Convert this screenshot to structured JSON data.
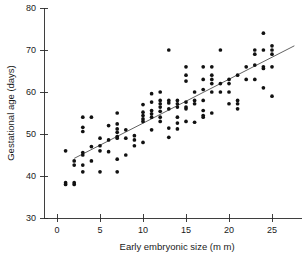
{
  "chart_data": {
    "type": "scatter",
    "title": "",
    "xlabel": "Early embryonic size (m m)",
    "ylabel": "Gestational age (days)",
    "xlim": [
      -1.5,
      28.5
    ],
    "ylim": [
      30,
      80
    ],
    "xticks": [
      0,
      5,
      10,
      15,
      20,
      25
    ],
    "yticks": [
      30,
      40,
      50,
      60,
      70,
      80
    ],
    "xtick_labels": [
      "0",
      "5",
      "10",
      "15",
      "20",
      "25"
    ],
    "ytick_labels": [
      "30",
      "40",
      "50",
      "60",
      "70",
      "80"
    ],
    "grid": false,
    "legend": null,
    "marker": "filled-circle",
    "marker_color": "#111111",
    "fit_line": {
      "label": "linear regression",
      "color": "#3a3a3a",
      "x_start": 2.0,
      "y_start": 44.2,
      "x_end": 27.6,
      "y_end": 71.0
    },
    "series": [
      {
        "name": "observations",
        "points": [
          [
            1,
            46
          ],
          [
            1,
            38.4
          ],
          [
            1,
            38.0
          ],
          [
            2,
            43.6
          ],
          [
            2,
            42.6
          ],
          [
            2,
            38.4
          ],
          [
            2,
            38.0
          ],
          [
            3,
            54
          ],
          [
            3,
            51.6
          ],
          [
            3,
            50.6
          ],
          [
            3,
            45.6
          ],
          [
            3,
            45.0
          ],
          [
            3,
            42.6
          ],
          [
            3,
            41.0
          ],
          [
            4,
            54
          ],
          [
            4,
            47.0
          ],
          [
            4,
            43.6
          ],
          [
            5,
            49.0
          ],
          [
            5,
            47.2
          ],
          [
            5,
            46.0
          ],
          [
            5,
            41.0
          ],
          [
            6,
            52.0
          ],
          [
            6,
            48.6
          ],
          [
            6,
            45.8
          ],
          [
            7,
            55.0
          ],
          [
            7,
            52.4
          ],
          [
            7,
            51.2
          ],
          [
            7,
            50.4
          ],
          [
            7,
            49.4
          ],
          [
            7,
            49.0
          ],
          [
            7,
            44.0
          ],
          [
            7,
            41.0
          ],
          [
            8,
            51.0
          ],
          [
            8,
            49.0
          ],
          [
            8,
            45.0
          ],
          [
            9,
            49.6
          ],
          [
            9,
            48.6
          ],
          [
            9,
            47.2
          ],
          [
            10,
            57.0
          ],
          [
            10,
            55.2
          ],
          [
            10,
            54.4
          ],
          [
            10,
            53.6
          ],
          [
            10,
            53.0
          ],
          [
            10,
            48.0
          ],
          [
            11,
            59.6
          ],
          [
            11,
            57.6
          ],
          [
            11,
            55.6
          ],
          [
            11,
            54.8
          ],
          [
            11,
            54.0
          ],
          [
            11,
            51.0
          ],
          [
            12,
            60.0
          ],
          [
            12,
            58.0
          ],
          [
            12,
            57.2
          ],
          [
            12,
            56.4
          ],
          [
            12,
            55.4
          ],
          [
            12,
            54.0
          ],
          [
            12,
            53.0
          ],
          [
            13,
            70.0
          ],
          [
            13,
            58.0
          ],
          [
            13,
            57.4
          ],
          [
            13,
            56.0
          ],
          [
            13,
            51.4
          ],
          [
            13,
            49.2
          ],
          [
            14,
            58.0
          ],
          [
            14,
            57.2
          ],
          [
            14,
            56.4
          ],
          [
            14,
            54.0
          ],
          [
            14,
            52.6
          ],
          [
            14,
            51.2
          ],
          [
            15,
            66.0
          ],
          [
            15,
            64.0
          ],
          [
            15,
            62.6
          ],
          [
            15,
            57.6
          ],
          [
            15,
            56.4
          ],
          [
            15,
            56.0
          ],
          [
            15,
            53.0
          ],
          [
            16,
            60.0
          ],
          [
            16,
            58.0
          ],
          [
            16,
            57.2
          ],
          [
            16,
            52.8
          ],
          [
            17,
            66.0
          ],
          [
            17,
            63.0
          ],
          [
            17,
            60.6
          ],
          [
            17,
            58.0
          ],
          [
            17,
            55.6
          ],
          [
            17,
            54.4
          ],
          [
            17,
            54.0
          ],
          [
            18,
            66.0
          ],
          [
            18,
            64.0
          ],
          [
            18,
            63.0
          ],
          [
            18,
            62.0
          ],
          [
            18,
            60.0
          ],
          [
            18,
            55.0
          ],
          [
            19,
            70.0
          ],
          [
            19,
            62.0
          ],
          [
            19,
            60.0
          ],
          [
            20,
            63.0
          ],
          [
            20,
            62.0
          ],
          [
            20,
            60.0
          ],
          [
            20,
            57.2
          ],
          [
            21,
            64.0
          ],
          [
            21,
            58.0
          ],
          [
            21,
            57.2
          ],
          [
            21,
            56.0
          ],
          [
            22,
            66.0
          ],
          [
            22,
            63.0
          ],
          [
            23,
            70.0
          ],
          [
            23,
            69.0
          ],
          [
            23,
            66.4
          ],
          [
            23,
            63.0
          ],
          [
            24,
            74.0
          ],
          [
            24,
            70.0
          ],
          [
            24,
            66.0
          ],
          [
            24,
            65.6
          ],
          [
            24,
            61.0
          ],
          [
            25,
            71.0
          ],
          [
            25,
            70.0
          ],
          [
            25,
            69.0
          ],
          [
            25,
            66.0
          ],
          [
            25,
            59.0
          ]
        ]
      }
    ]
  }
}
